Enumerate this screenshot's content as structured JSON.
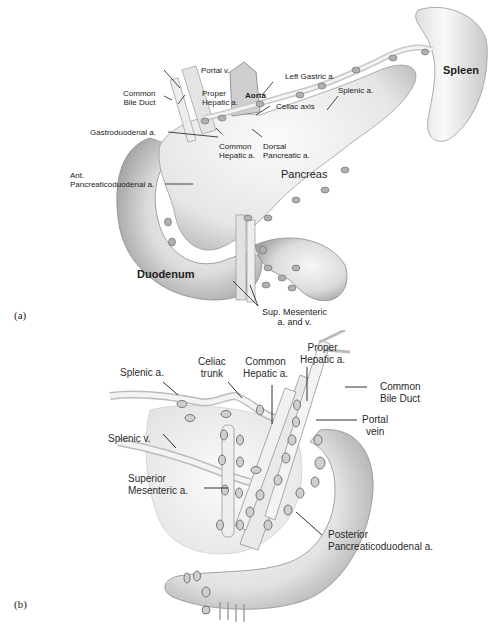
{
  "figure": {
    "panel_a": {
      "tag": "(a)",
      "organs": {
        "spleen": "Spleen",
        "pancreas": "Pancreas",
        "duodenum": "Duodenum"
      },
      "labels": {
        "portal_v": "Portal v.",
        "common_bile_duct": "Common\nBile Duct",
        "proper_hepatic": "Proper\nHepatic a.",
        "aorta": "Aorta",
        "left_gastric": "Left Gastric a.",
        "celiac_axis": "Celiac axis",
        "splenic_a": "Splenic a.",
        "gastroduodenal": "Gastroduodenal a.",
        "common_hepatic": "Common\nHepatic a.",
        "dorsal_pancreatic": "Dorsal\nPancreatic a.",
        "ant_pancreaticoduodenal": "Ant.\nPancreaticoduodenal a.",
        "sup_mesenteric": "Sup. Mesenteric\na. and v."
      }
    },
    "panel_b": {
      "tag": "(b)",
      "labels": {
        "splenic_a": "Splenic a.",
        "celiac_trunk": "Celiac\ntrunk",
        "common_hepatic": "Common\nHepatic a.",
        "proper_hepatic": "Proper\nHepatic a.",
        "common_bile_duct": "Common\nBile Duct",
        "portal_vein": "Portal\nvein",
        "splenic_v": "Splenic v.",
        "superior_mesenteric": "Superior\nMesenteric a.",
        "posterior_pancreaticoduodenal": "Posterior\nPancreaticoduodenal a."
      }
    },
    "colors": {
      "background": "#ffffff",
      "organ_fill": "#ececec",
      "organ_shade": "#bdbdbd",
      "vessel": "#d9d9d9",
      "node": "#8a8a8a",
      "leader_line": "#1a1a1a",
      "text": "#222222"
    }
  }
}
